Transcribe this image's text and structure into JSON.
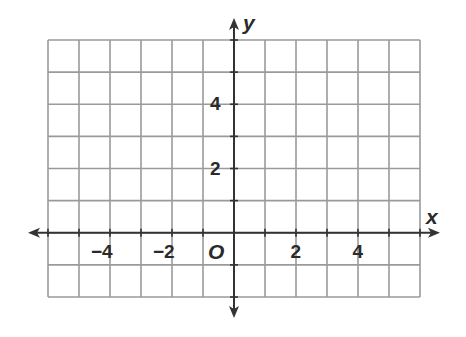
{
  "chart_data": {
    "type": "coordinate_grid",
    "title": "",
    "xlabel": "x",
    "ylabel": "y",
    "origin_label": "O",
    "xlim": [
      -6,
      6
    ],
    "ylim": [
      -2,
      6
    ],
    "grid": true,
    "grid_step": 1,
    "x_tick_labels": [
      {
        "value": -4,
        "label": "−4"
      },
      {
        "value": -2,
        "label": "−2"
      },
      {
        "value": 2,
        "label": "2"
      },
      {
        "value": 4,
        "label": "4"
      }
    ],
    "y_tick_labels": [
      {
        "value": 2,
        "label": "2"
      },
      {
        "value": 4,
        "label": "4"
      }
    ],
    "series": []
  },
  "colors": {
    "grid": "#9a9a9a",
    "axis": "#333333",
    "text": "#2a2a2a"
  }
}
